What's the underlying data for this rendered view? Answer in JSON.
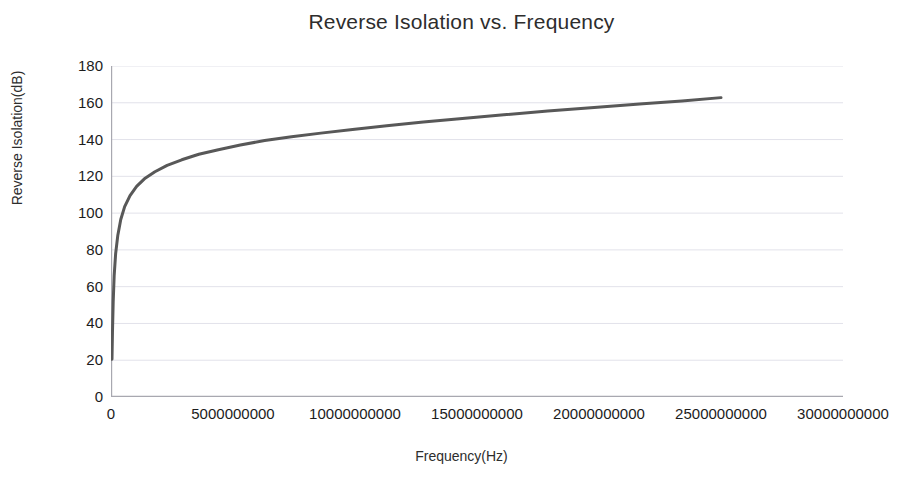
{
  "chart_data": {
    "type": "line",
    "title": "Reverse Isolation vs. Frequency",
    "xlabel": "Frequency(Hz)",
    "ylabel": "Reverse Isolation(dB)",
    "xlim": [
      0,
      30000000000
    ],
    "ylim": [
      0,
      180
    ],
    "grid": true,
    "legend": "none",
    "line_color": "#585858",
    "line_width": 3,
    "xticks": [
      0,
      5000000000,
      10000000000,
      15000000000,
      20000000000,
      25000000000,
      30000000000
    ],
    "xtick_labels": [
      "0",
      "5000000000",
      "10000000000",
      "15000000000",
      "20000000000",
      "25000000000",
      "30000000000"
    ],
    "yticks": [
      0,
      20,
      40,
      60,
      80,
      100,
      120,
      140,
      160,
      180
    ],
    "ytick_labels": [
      "0",
      "20",
      "40",
      "60",
      "80",
      "100",
      "120",
      "140",
      "160",
      "180"
    ],
    "series": [
      {
        "name": "Reverse Isolation",
        "x": [
          40000000,
          60000000,
          90000000,
          130000000,
          190000000,
          280000000,
          400000000,
          560000000,
          780000000,
          1050000000,
          1400000000,
          1800000000,
          2300000000,
          2900000000,
          3600000000,
          4400000000,
          5300000000,
          6300000000,
          7400000000,
          8600000000,
          9900000000,
          11300000000,
          12800000000,
          14400000000,
          16100000000,
          17900000000,
          19800000000,
          21800000000,
          23400000000,
          25000000000
        ],
        "y": [
          20.5,
          35.0,
          52.0,
          66.0,
          78.0,
          88.0,
          96.5,
          103.5,
          109.5,
          114.5,
          119.0,
          122.5,
          126.0,
          129.0,
          132.0,
          134.5,
          137.0,
          139.5,
          141.5,
          143.5,
          145.5,
          147.5,
          149.5,
          151.5,
          153.5,
          155.5,
          157.5,
          159.5,
          161.0,
          162.8
        ]
      }
    ]
  }
}
